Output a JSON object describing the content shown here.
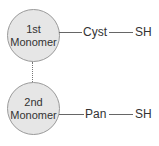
{
  "diagram": {
    "nodes": [
      {
        "id": "monomer-1",
        "line1": "1st",
        "line2": "Monomer",
        "chain": [
          "Cyst",
          "SH"
        ]
      },
      {
        "id": "monomer-2",
        "line1": "2nd",
        "line2": "Monomer",
        "chain": [
          "Pan",
          "SH"
        ]
      }
    ],
    "connector": "dotted",
    "colors": {
      "circle_fill": "#e6e6e6",
      "circle_stroke": "#9a9a9a",
      "line": "#666666",
      "text": "#333333"
    }
  }
}
